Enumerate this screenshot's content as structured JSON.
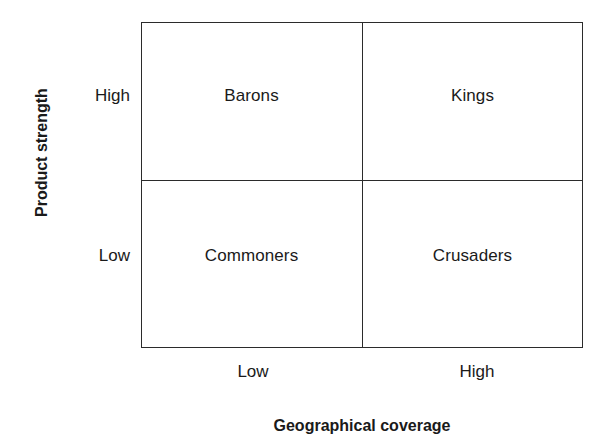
{
  "chart_data": {
    "type": "table",
    "title": "",
    "xlabel": "Geographical coverage",
    "ylabel": "Product strength",
    "x_categories": [
      "Low",
      "High"
    ],
    "y_categories": [
      "Low",
      "High"
    ],
    "grid": true,
    "legend": "none",
    "cells": [
      {
        "x": "Low",
        "y": "High",
        "label": "Barons",
        "position": "top-left"
      },
      {
        "x": "High",
        "y": "High",
        "label": "Kings",
        "position": "top-right"
      },
      {
        "x": "Low",
        "y": "Low",
        "label": "Commoners",
        "position": "bottom-left"
      },
      {
        "x": "High",
        "y": "Low",
        "label": "Crusaders",
        "position": "bottom-right"
      }
    ]
  },
  "axes": {
    "y": {
      "title": "Product strength",
      "ticks": {
        "high": "High",
        "low": "Low"
      }
    },
    "x": {
      "title": "Geographical coverage",
      "ticks": {
        "low": "Low",
        "high": "High"
      }
    }
  },
  "quadrants": {
    "top_left": "Barons",
    "top_right": "Kings",
    "bottom_left": "Commoners",
    "bottom_right": "Crusaders"
  },
  "colors": {
    "line": "#2b2b2b",
    "text": "#1a1a1a",
    "background": "#ffffff"
  }
}
